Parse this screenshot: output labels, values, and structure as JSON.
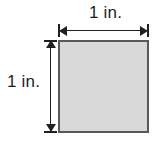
{
  "figure": {
    "type": "geometry-diagram",
    "shape": "square",
    "background_color": "#ffffff",
    "square": {
      "fill_color": "#d9d9d9",
      "stroke_color": "#58595b",
      "side_length_label": "1 in."
    },
    "dimensions": {
      "top": {
        "label": "1 in.",
        "orientation": "horizontal",
        "arrow_style": "double-headed-with-serif-caps",
        "color": "#231f20"
      },
      "left": {
        "label": "1 in.",
        "orientation": "vertical",
        "arrow_style": "double-headed-with-serif-caps",
        "color": "#231f20"
      }
    }
  }
}
